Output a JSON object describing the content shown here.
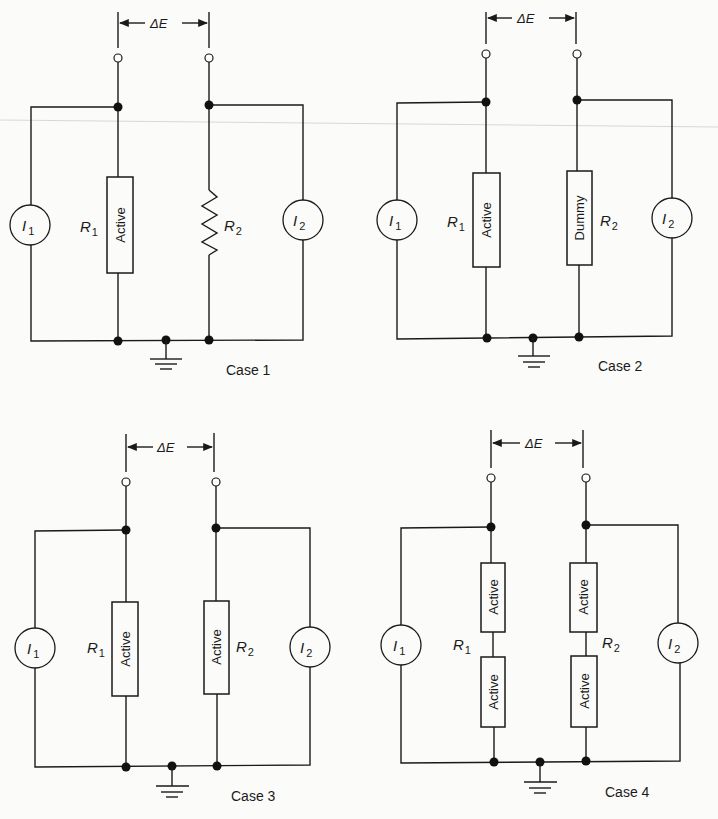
{
  "figure": {
    "common": {
      "delta_label": "ΔE",
      "source_left": {
        "symbol": "I",
        "subscript": "1"
      },
      "source_right": {
        "symbol": "I",
        "subscript": "2"
      },
      "resistor_left": {
        "symbol": "R",
        "subscript": "1"
      },
      "resistor_right": {
        "symbol": "R",
        "subscript": "2"
      }
    },
    "cases": [
      {
        "label": "Case 1",
        "r1_elements": [
          "Active"
        ],
        "r2_elements": [
          "resistor (zigzag)"
        ]
      },
      {
        "label": "Case 2",
        "r1_elements": [
          "Active"
        ],
        "r2_elements": [
          "Dummy"
        ]
      },
      {
        "label": "Case 3",
        "r1_elements": [
          "Active"
        ],
        "r2_elements": [
          "Active"
        ]
      },
      {
        "label": "Case 4",
        "r1_elements": [
          "Active",
          "Active"
        ],
        "r2_elements": [
          "Active",
          "Active"
        ]
      }
    ]
  },
  "labels": {
    "delta_e": "ΔE",
    "i": "I",
    "r": "R",
    "sub1": "1",
    "sub2": "2",
    "active": "Active",
    "dummy": "Dummy",
    "case1": "Case 1",
    "case2": "Case 2",
    "case3": "Case 3",
    "case4": "Case 4"
  },
  "colors": {
    "ink": "#1a1a1a",
    "paper": "#fbfbf9"
  }
}
